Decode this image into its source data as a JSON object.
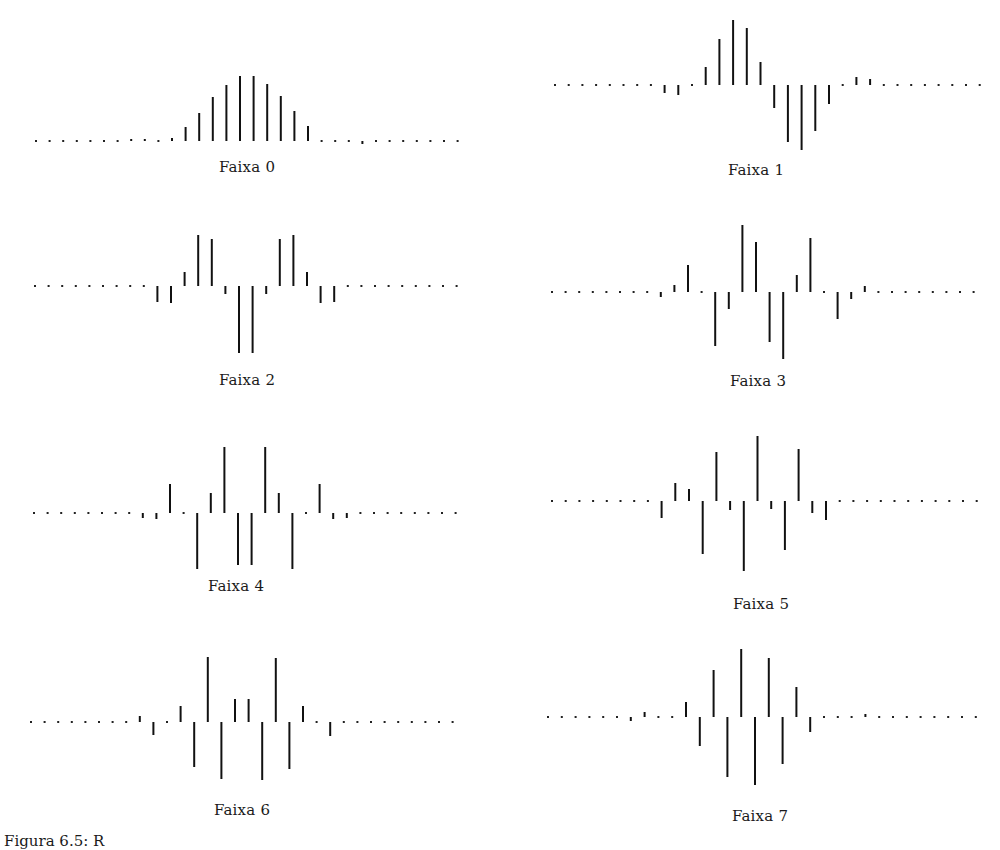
{
  "figure": {
    "caption": "Figura 6.5: R"
  },
  "chart_data": [
    {
      "type": "stem",
      "title": "Faixa 0",
      "baseline_y": 141,
      "x0": 36,
      "dx": 13.6,
      "label_x": 247,
      "label_y": 158,
      "values": [
        0,
        0,
        0,
        0,
        0,
        1,
        1,
        2,
        2,
        1,
        3,
        14,
        28,
        44,
        56,
        65,
        65,
        57,
        45,
        30,
        15,
        4,
        1,
        -1,
        -3,
        -3,
        1,
        0,
        0,
        0,
        0,
        0
      ],
      "dot_only": [
        0,
        1,
        2,
        3,
        4,
        5,
        6,
        9,
        21,
        22,
        25,
        26,
        27,
        28,
        29,
        30,
        31
      ],
      "xlabel": "",
      "ylabel": ""
    },
    {
      "type": "stem",
      "title": "Faixa 1",
      "baseline_y": 85,
      "x0": 555,
      "dx": 13.7,
      "label_x": 756,
      "label_y": 161,
      "values": [
        0,
        0,
        0,
        0,
        0,
        0,
        0,
        0,
        -8,
        -10,
        0,
        18,
        46,
        65,
        57,
        23,
        -23,
        -57,
        -65,
        -46,
        -19,
        0,
        8,
        6,
        0,
        0,
        0,
        0,
        0,
        0,
        0,
        0
      ],
      "dot_only": [
        0,
        1,
        2,
        3,
        4,
        5,
        6,
        7,
        10,
        21,
        24,
        25,
        26,
        27,
        28,
        29,
        30,
        31
      ],
      "xlabel": "",
      "ylabel": ""
    },
    {
      "type": "stem",
      "title": "Faixa 2",
      "baseline_y": 286,
      "x0": 35,
      "dx": 13.6,
      "label_x": 247,
      "label_y": 371,
      "values": [
        0,
        0,
        0,
        0,
        0,
        0,
        0,
        0,
        -2,
        -16,
        -17,
        14,
        51,
        47,
        -8,
        -67,
        -67,
        -8,
        47,
        51,
        14,
        -17,
        -16,
        -2,
        0,
        0,
        0,
        0,
        0,
        0,
        0,
        0
      ],
      "dot_only": [
        0,
        1,
        2,
        3,
        4,
        5,
        6,
        7,
        8,
        23,
        24,
        25,
        26,
        27,
        28,
        29,
        30,
        31
      ],
      "xlabel": "",
      "ylabel": ""
    },
    {
      "type": "stem",
      "title": "Faixa 3",
      "baseline_y": 292,
      "x0": 552,
      "dx": 13.6,
      "label_x": 758,
      "label_y": 372,
      "values": [
        0,
        0,
        0,
        0,
        0,
        0,
        0,
        0,
        -5,
        7,
        27,
        -3,
        -54,
        -17,
        67,
        50,
        -50,
        -67,
        17,
        54,
        3,
        -27,
        -7,
        6,
        0,
        0,
        0,
        0,
        0,
        0,
        0,
        0
      ],
      "dot_only": [
        0,
        1,
        2,
        3,
        4,
        5,
        6,
        7,
        11,
        20,
        24,
        25,
        26,
        27,
        28,
        29,
        30,
        31
      ],
      "xlabel": "",
      "ylabel": ""
    },
    {
      "type": "stem",
      "title": "Faixa 4",
      "baseline_y": 513,
      "x0": 34,
      "dx": 13.6,
      "label_x": 236,
      "label_y": 577,
      "values": [
        0,
        0,
        0,
        0,
        0,
        0,
        0,
        0,
        -5,
        -6,
        29,
        -2,
        -56,
        20,
        66,
        -52,
        -52,
        66,
        20,
        -56,
        -2,
        29,
        -6,
        -5,
        0,
        0,
        0,
        0,
        0,
        0,
        0,
        0
      ],
      "dot_only": [
        0,
        1,
        2,
        3,
        4,
        5,
        6,
        7,
        11,
        20,
        24,
        25,
        26,
        27,
        28,
        29,
        30,
        31
      ],
      "xlabel": "",
      "ylabel": ""
    },
    {
      "type": "stem",
      "title": "Faixa 5",
      "baseline_y": 501,
      "x0": 552,
      "dx": 13.7,
      "label_x": 761,
      "label_y": 595,
      "values": [
        0,
        0,
        0,
        0,
        0,
        0,
        0,
        0,
        -17,
        18,
        12,
        -53,
        49,
        -9,
        -70,
        65,
        -8,
        -49,
        52,
        -12,
        -19,
        17,
        0,
        0,
        0,
        0,
        0,
        0,
        0,
        0,
        0,
        0
      ],
      "dot_only": [
        0,
        1,
        2,
        3,
        4,
        5,
        6,
        7,
        21,
        22,
        23,
        24,
        25,
        26,
        27,
        28,
        29,
        30,
        31
      ],
      "xlabel": "",
      "ylabel": ""
    },
    {
      "type": "stem",
      "title": "Faixa 6",
      "baseline_y": 722,
      "x0": 31,
      "dx": 13.6,
      "label_x": 242,
      "label_y": 801,
      "values": [
        0,
        0,
        0,
        0,
        0,
        0,
        0,
        0,
        6,
        -13,
        3,
        16,
        -45,
        65,
        -57,
        23,
        23,
        -58,
        64,
        -47,
        16,
        3,
        -14,
        6,
        0,
        0,
        0,
        0,
        0,
        0,
        0,
        0
      ],
      "dot_only": [
        0,
        1,
        2,
        3,
        4,
        5,
        6,
        7,
        10,
        21,
        23,
        24,
        25,
        26,
        27,
        28,
        29,
        30,
        31
      ],
      "xlabel": "",
      "ylabel": ""
    },
    {
      "type": "stem",
      "title": "Faixa 7",
      "baseline_y": 717,
      "x0": 548,
      "dx": 13.8,
      "label_x": 760,
      "label_y": 807,
      "values": [
        0,
        0,
        0,
        0,
        0,
        0,
        -4,
        5,
        0,
        -3,
        15,
        -29,
        47,
        -60,
        68,
        -68,
        59,
        -47,
        30,
        -15,
        0,
        0,
        -5,
        3,
        0,
        0,
        0,
        0,
        0,
        0,
        0,
        0
      ],
      "dot_only": [
        0,
        1,
        2,
        3,
        4,
        5,
        8,
        9,
        20,
        21,
        22,
        24,
        25,
        26,
        27,
        28,
        29,
        30,
        31
      ],
      "xlabel": "",
      "ylabel": ""
    }
  ]
}
